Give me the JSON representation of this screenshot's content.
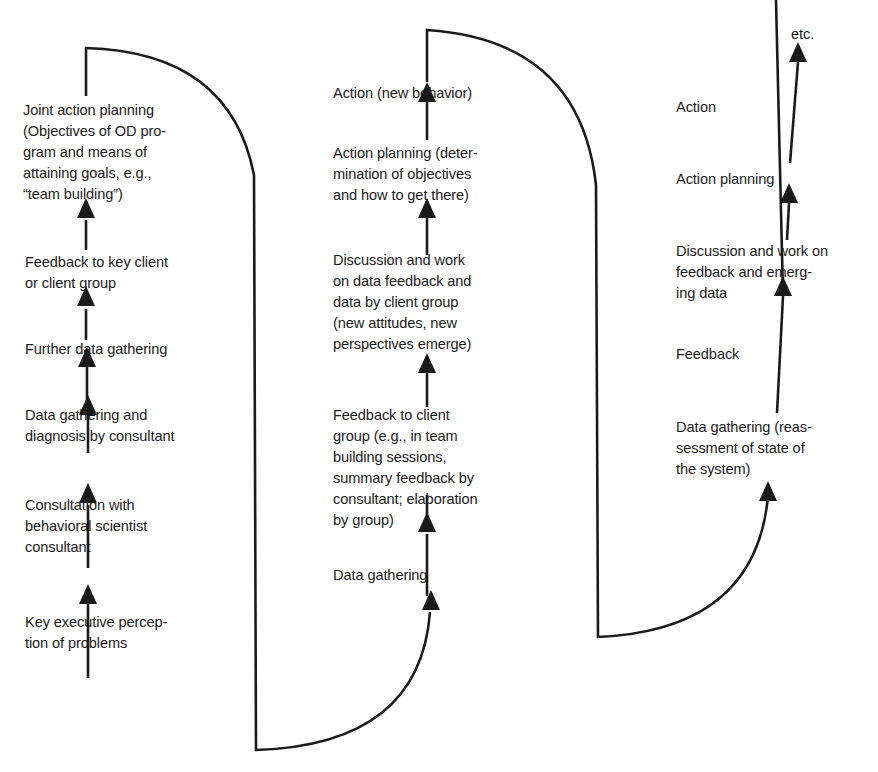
{
  "diagram": {
    "type": "action-research-cycle",
    "columns": [
      {
        "id": "cycle-1",
        "steps": [
          {
            "order": 1,
            "text": "Key executive percep-\ntion of problems"
          },
          {
            "order": 2,
            "text": "Consultation with\nbehavioral scientist\nconsultant"
          },
          {
            "order": 3,
            "text": "Data gathering and\ndiagnosis by consultant"
          },
          {
            "order": 4,
            "text": "Further data gathering"
          },
          {
            "order": 5,
            "text": "Feedback to key client\nor client group"
          },
          {
            "order": 6,
            "text": "Joint action planning\n(Objectives of OD pro-\ngram and means of\nattaining goals, e.g.,\n“team building”)"
          }
        ]
      },
      {
        "id": "cycle-2",
        "steps": [
          {
            "order": 1,
            "text": "Data gathering"
          },
          {
            "order": 2,
            "text": "Feedback to client\ngroup (e.g., in team\nbuilding sessions,\nsummary feedback by\nconsultant; elaboration\nby group)"
          },
          {
            "order": 3,
            "text": "Discussion and work\non data feedback and\ndata by client group\n(new attitudes, new\nperspectives emerge)"
          },
          {
            "order": 4,
            "text": "Action planning (deter-\nmination of objectives\nand how to get there)"
          },
          {
            "order": 5,
            "text": "Action (new behavior)"
          }
        ]
      },
      {
        "id": "cycle-3",
        "steps": [
          {
            "order": 1,
            "text": "Data gathering (reas-\nsessment of state of\nthe system)"
          },
          {
            "order": 2,
            "text": "Feedback"
          },
          {
            "order": 3,
            "text": "Discussion and work on\nfeedback and emerg-\ning data"
          },
          {
            "order": 4,
            "text": "Action planning"
          },
          {
            "order": 5,
            "text": "Action"
          },
          {
            "order": 6,
            "text": "etc."
          }
        ]
      }
    ],
    "colors": {
      "ink": "#1a1a1a",
      "background": "#ffffff"
    }
  }
}
